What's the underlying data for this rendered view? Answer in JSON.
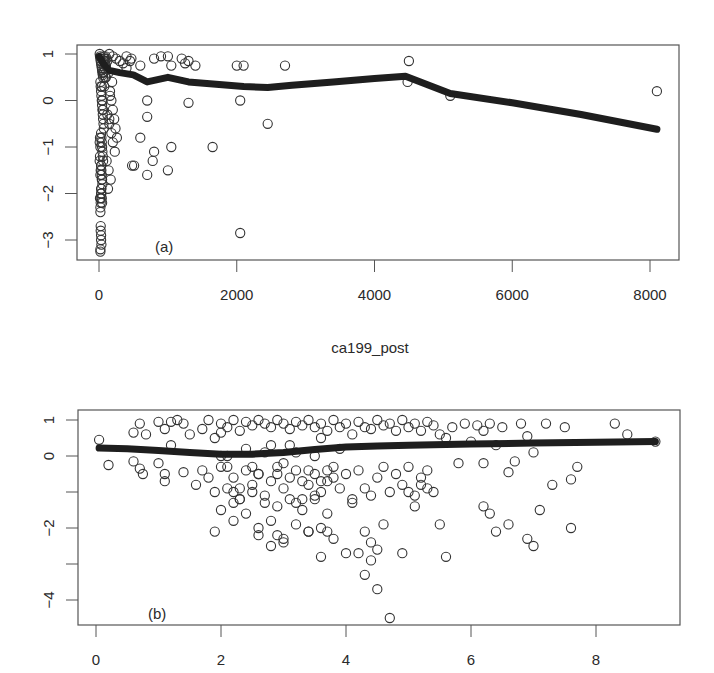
{
  "chart_data": [
    {
      "id": "a",
      "type": "scatter",
      "panel_label": "(a)",
      "title": "",
      "xlabel": "ca199_post",
      "ylabel": "",
      "xlim": [
        -150,
        8400
      ],
      "ylim": [
        -3.35,
        1.15
      ],
      "x_ticks": [
        0,
        2000,
        4000,
        6000,
        8000
      ],
      "x_tick_labels": [
        "0",
        "2000",
        "4000",
        "6000",
        "8000"
      ],
      "y_ticks": [
        1,
        0,
        -1,
        -2,
        -3
      ],
      "y_tick_labels": [
        "1",
        "0",
        "-1",
        "-2",
        "-3"
      ],
      "grid": false,
      "legend": null,
      "smooth_line": {
        "x": [
          0,
          60,
          150,
          300,
          500,
          700,
          1000,
          1300,
          1700,
          2100,
          2450,
          2800,
          3400,
          4000,
          4450,
          5100,
          6000,
          7000,
          8100
        ],
        "y": [
          0.95,
          0.8,
          0.65,
          0.6,
          0.55,
          0.4,
          0.5,
          0.4,
          0.35,
          0.3,
          0.28,
          0.33,
          0.4,
          0.47,
          0.52,
          0.15,
          -0.05,
          -0.3,
          -0.62
        ]
      },
      "points": {
        "x": [
          10,
          15,
          20,
          25,
          30,
          35,
          40,
          45,
          50,
          55,
          60,
          65,
          70,
          80,
          90,
          100,
          110,
          120,
          20,
          25,
          30,
          35,
          40,
          45,
          50,
          55,
          60,
          65,
          70,
          30,
          35,
          40,
          45,
          50,
          55,
          60,
          30,
          35,
          40,
          45,
          50,
          30,
          35,
          40,
          45,
          20,
          25,
          30,
          35,
          40,
          20,
          25,
          30,
          35,
          20,
          25,
          30,
          20,
          25,
          15,
          20,
          25,
          30,
          10,
          15,
          20,
          10,
          15,
          40,
          60,
          150,
          200,
          250,
          300,
          350,
          400,
          450,
          160,
          180,
          200,
          220,
          240,
          260,
          120,
          150,
          180,
          200,
          230,
          110,
          140,
          170,
          130,
          160,
          190,
          100,
          140,
          600,
          800,
          900,
          1000,
          1200,
          1250,
          1300,
          400,
          470,
          1050,
          1400,
          2000,
          2100,
          2700,
          4500,
          5100,
          700,
          1300,
          2050,
          2450,
          600,
          1050,
          1650,
          510,
          700,
          800,
          1000,
          150,
          480,
          700,
          2050,
          780,
          4480,
          8100,
          50,
          60,
          70,
          80,
          90,
          75,
          85,
          95,
          520,
          560
        ],
        "y": [
          1.0,
          0.95,
          0.9,
          0.85,
          0.8,
          0.75,
          0.7,
          0.65,
          0.6,
          0.55,
          0.5,
          0.95,
          0.9,
          0.85,
          0.8,
          0.75,
          0.9,
          0.85,
          0.4,
          0.3,
          0.2,
          0.1,
          0.0,
          -0.1,
          -0.2,
          -0.3,
          -0.4,
          -0.5,
          -0.6,
          -0.7,
          -0.8,
          -0.9,
          -1.0,
          -1.1,
          -1.2,
          -1.3,
          -1.4,
          -1.5,
          -1.6,
          -1.7,
          -1.8,
          -1.9,
          -2.0,
          -2.1,
          -2.2,
          -2.3,
          -2.1,
          -2.0,
          -1.9,
          -1.7,
          -2.4,
          -2.7,
          -2.9,
          -3.1,
          -3.2,
          -2.8,
          -3.0,
          -3.25,
          -2.2,
          -2.1,
          -1.6,
          -1.5,
          -1.4,
          -1.3,
          -1.2,
          -1.0,
          -0.9,
          -0.8,
          0.3,
          0.6,
          1.0,
          0.95,
          0.9,
          0.85,
          0.8,
          0.95,
          0.85,
          0.1,
          0.0,
          -0.2,
          -0.4,
          -0.6,
          -0.8,
          -0.3,
          -0.5,
          -0.7,
          -0.9,
          -1.1,
          -1.3,
          -1.5,
          -1.7,
          -1.9,
          0.2,
          0.4,
          0.5,
          0.6,
          0.75,
          0.9,
          0.95,
          0.95,
          0.9,
          0.8,
          0.85,
          0.7,
          0.9,
          0.75,
          0.75,
          0.75,
          0.75,
          0.75,
          0.85,
          0.1,
          0.0,
          -0.05,
          0.0,
          -0.5,
          -0.8,
          -1.0,
          -1.0,
          -1.4,
          -1.6,
          -1.1,
          -1.5,
          -0.4,
          -1.4,
          -0.35,
          -2.85,
          -1.3,
          0.4,
          0.2,
          0.0,
          -0.2,
          0.6,
          0.7,
          0.5,
          0.3,
          0.9,
          0.95
        ]
      }
    },
    {
      "id": "b",
      "type": "scatter",
      "panel_label": "(b)",
      "title": "",
      "xlabel": "",
      "ylabel": "",
      "xlim": [
        -0.3,
        9.35
      ],
      "ylim": [
        -4.75,
        1.3
      ],
      "x_ticks": [
        0,
        2,
        4,
        6,
        8
      ],
      "x_tick_labels": [
        "0",
        "2",
        "4",
        "6",
        "8"
      ],
      "y_ticks": [
        1,
        0,
        -2,
        -4
      ],
      "y_tick_labels": [
        "1",
        "0",
        "-2",
        "-4"
      ],
      "y_minor_ticks": [
        -1,
        -3
      ],
      "grid": false,
      "legend": null,
      "smooth_line": {
        "x": [
          0.05,
          0.5,
          1.0,
          1.5,
          2.0,
          2.5,
          3.0,
          3.5,
          4.0,
          4.5,
          5.0,
          6.0,
          7.0,
          8.0,
          8.95
        ],
        "y": [
          0.22,
          0.2,
          0.15,
          0.1,
          0.05,
          0.05,
          0.1,
          0.18,
          0.25,
          0.28,
          0.3,
          0.33,
          0.36,
          0.38,
          0.4
        ]
      },
      "points": {
        "x": [
          0.05,
          0.2,
          0.6,
          0.6,
          0.7,
          0.7,
          0.75,
          0.8,
          1.0,
          1.0,
          1.1,
          1.1,
          1.1,
          1.2,
          1.2,
          1.3,
          1.4,
          1.4,
          1.5,
          1.6,
          1.7,
          1.7,
          1.8,
          1.8,
          1.9,
          1.9,
          1.9,
          2.0,
          2.0,
          2.0,
          2.1,
          2.1,
          2.2,
          2.2,
          2.3,
          2.3,
          2.4,
          2.4,
          2.5,
          2.5,
          2.6,
          2.6,
          2.7,
          2.7,
          2.8,
          2.8,
          2.9,
          2.9,
          3.0,
          3.0,
          3.1,
          3.1,
          3.2,
          3.2,
          3.3,
          3.3,
          3.4,
          3.4,
          3.5,
          3.5,
          3.6,
          3.6,
          3.7,
          3.7,
          3.8,
          3.8,
          3.9,
          3.9,
          4.0,
          4.0,
          4.1,
          4.1,
          4.2,
          4.2,
          4.3,
          4.3,
          4.4,
          4.4,
          4.5,
          4.5,
          4.6,
          4.6,
          4.7,
          4.7,
          4.8,
          4.8,
          4.9,
          4.9,
          5.0,
          5.0,
          5.1,
          5.1,
          5.2,
          5.2,
          5.3,
          5.3,
          5.4,
          5.4,
          5.5,
          5.6,
          5.7,
          5.8,
          5.9,
          6.0,
          6.1,
          6.2,
          6.2,
          6.3,
          6.4,
          6.5,
          6.6,
          6.7,
          6.8,
          6.9,
          7.0,
          7.1,
          7.2,
          7.3,
          7.5,
          7.6,
          7.7,
          8.3,
          8.5,
          8.95,
          2.0,
          2.1,
          2.2,
          2.4,
          2.6,
          2.8,
          3.0,
          3.2,
          3.4,
          3.6,
          3.8,
          2.0,
          2.3,
          2.5,
          2.7,
          2.9,
          3.1,
          3.3,
          3.5,
          3.7,
          3.9,
          2.1,
          2.3,
          2.5,
          2.7,
          2.9,
          3.1,
          3.3,
          3.5,
          3.7,
          2.2,
          2.4,
          2.6,
          2.8,
          3.0,
          3.2,
          3.4,
          3.6,
          2.2,
          2.6,
          2.9,
          3.4,
          3.6,
          3.7,
          3.8,
          4.5,
          4.3,
          4.5,
          4.7,
          4.0,
          4.4,
          5.6,
          6.4,
          6.6,
          6.9,
          7.0,
          7.6,
          6.2,
          6.3,
          5.5,
          4.1,
          4.3,
          4.9,
          5.0,
          5.1,
          5.2,
          5.3,
          3.5,
          3.6,
          3.2,
          3.0,
          2.8,
          4.2,
          4.4,
          4.6
        ],
        "y": [
          0.45,
          -0.25,
          0.65,
          -0.15,
          0.9,
          -0.35,
          -0.5,
          0.6,
          0.95,
          -0.2,
          0.75,
          -0.5,
          -0.7,
          0.95,
          0.3,
          1.0,
          0.9,
          -0.45,
          0.6,
          -0.8,
          0.75,
          -0.4,
          1.0,
          -0.6,
          0.5,
          -1.0,
          -2.1,
          0.9,
          -0.3,
          -1.5,
          0.8,
          -0.9,
          1.0,
          -0.6,
          0.7,
          -1.2,
          0.95,
          -0.4,
          0.85,
          -0.8,
          1.0,
          -0.5,
          0.9,
          -1.1,
          0.8,
          -0.7,
          1.0,
          -0.3,
          0.9,
          -0.9,
          0.75,
          -0.6,
          0.95,
          -0.4,
          0.85,
          -1.2,
          1.0,
          -0.8,
          0.8,
          -0.5,
          0.9,
          -1.0,
          0.7,
          -0.7,
          1.0,
          -0.3,
          0.8,
          -0.9,
          0.9,
          -0.5,
          0.6,
          -1.2,
          0.95,
          -0.4,
          0.8,
          -0.9,
          0.75,
          -1.1,
          1.0,
          -0.6,
          0.85,
          -0.3,
          0.9,
          -1.0,
          0.7,
          -0.5,
          1.0,
          -0.8,
          0.8,
          -0.3,
          0.9,
          -1.1,
          0.7,
          -0.6,
          0.95,
          -0.4,
          0.85,
          -1.0,
          0.6,
          0.5,
          0.8,
          -0.2,
          0.9,
          0.4,
          0.85,
          0.7,
          -0.2,
          0.9,
          0.3,
          0.8,
          -0.45,
          -0.15,
          0.9,
          0.55,
          0.1,
          -1.5,
          0.9,
          -0.8,
          0.8,
          -0.65,
          -0.3,
          0.9,
          0.6,
          0.4,
          0.65,
          0.0,
          -1.0,
          0.2,
          -0.5,
          0.3,
          -0.2,
          0.1,
          -0.4,
          0.5,
          -0.6,
          0.0,
          -0.9,
          -0.3,
          0.1,
          -0.5,
          0.3,
          -0.7,
          0.0,
          -0.4,
          0.2,
          -0.3,
          -1.2,
          -1.0,
          -1.3,
          -1.4,
          -1.2,
          -1.5,
          -1.1,
          -1.6,
          -1.3,
          -1.6,
          -2.0,
          -1.8,
          -2.3,
          -1.9,
          -2.1,
          -2.0,
          -1.8,
          -2.2,
          -2.2,
          -2.1,
          -2.8,
          -2.1,
          -2.3,
          -2.6,
          -3.3,
          -3.7,
          -4.5,
          -2.7,
          -2.4,
          -2.8,
          -2.1,
          -1.9,
          -2.3,
          -2.5,
          -2.0,
          -1.4,
          -1.6,
          -1.9,
          -1.3,
          -2.1,
          -2.7,
          -1.0,
          -1.4,
          -0.8,
          -0.9,
          -1.2,
          -0.7,
          -1.3,
          -2.4,
          -2.5,
          -2.7,
          -2.9,
          -1.9,
          -1.7,
          -1.6
        ]
      }
    }
  ]
}
